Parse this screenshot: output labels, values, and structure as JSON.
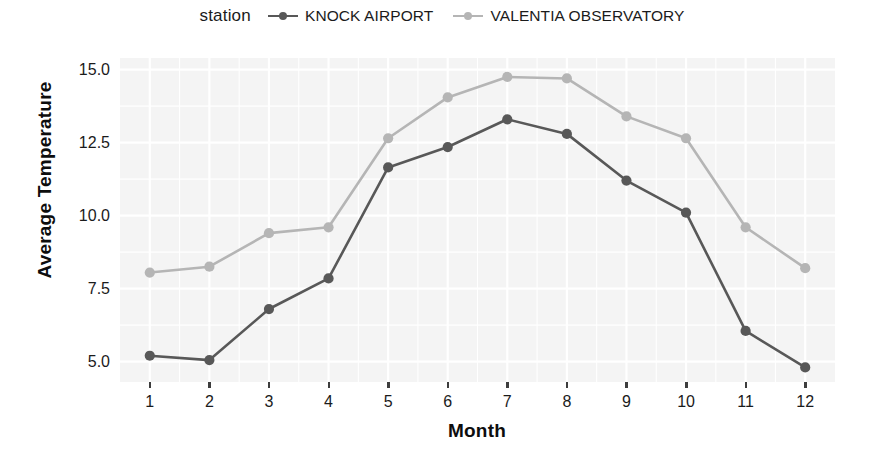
{
  "legend": {
    "title": "station",
    "position": "top",
    "entries": [
      {
        "label": "KNOCK AIRPORT",
        "color": "#585858",
        "key_icon": "line-point-key-icon"
      },
      {
        "label": "VALENTIA OBSERVATORY",
        "color": "#b5b5b5",
        "key_icon": "line-point-key-icon"
      }
    ]
  },
  "axes": {
    "x_title": "Month",
    "y_title": "Average Temperature",
    "x_ticks": [
      "1",
      "2",
      "3",
      "4",
      "5",
      "6",
      "7",
      "8",
      "9",
      "10",
      "11",
      "12"
    ],
    "y_ticks": [
      "5.0",
      "7.5",
      "10.0",
      "12.5",
      "15.0"
    ]
  },
  "chart_data": {
    "type": "line",
    "title": "",
    "subtitle": "",
    "xlabel": "Month",
    "ylabel": "Average Temperature",
    "legend_title": "station",
    "legend_position": "top",
    "grid": true,
    "x": [
      1,
      2,
      3,
      4,
      5,
      6,
      7,
      8,
      9,
      10,
      11,
      12
    ],
    "categories": [
      "1",
      "2",
      "3",
      "4",
      "5",
      "6",
      "7",
      "8",
      "9",
      "10",
      "11",
      "12"
    ],
    "xlim": [
      0.5,
      12.5
    ],
    "ylim": [
      4.3,
      15.4
    ],
    "y_ticks": [
      5.0,
      7.5,
      10.0,
      12.5,
      15.0
    ],
    "markers": "filled-circle",
    "series": [
      {
        "name": "KNOCK AIRPORT",
        "color": "#585858",
        "values": [
          5.2,
          5.05,
          6.8,
          7.85,
          11.65,
          12.35,
          13.3,
          12.8,
          11.2,
          10.1,
          6.05,
          4.8
        ]
      },
      {
        "name": "VALENTIA OBSERVATORY",
        "color": "#b5b5b5",
        "values": [
          8.05,
          8.25,
          9.4,
          9.6,
          12.65,
          14.05,
          14.75,
          14.7,
          13.4,
          12.65,
          9.6,
          8.2
        ]
      }
    ]
  },
  "style": {
    "panel_bg": "#f4f4f4",
    "grid_color": "#ffffff",
    "page_bg": "#ffffff",
    "text_color": "#1b1b1b"
  }
}
